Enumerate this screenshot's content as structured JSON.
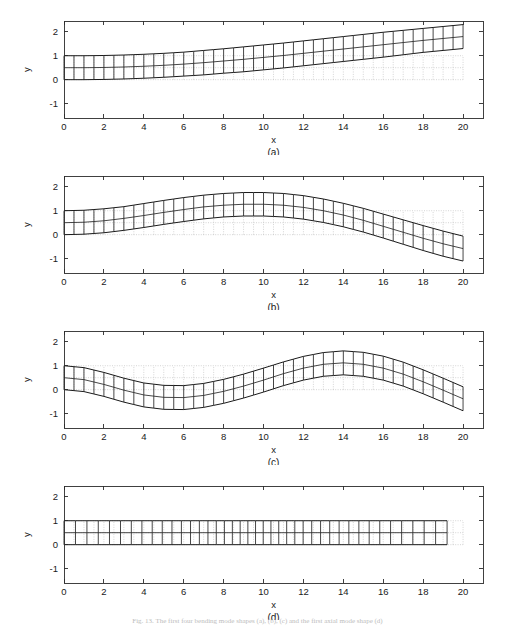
{
  "figure": {
    "width": 515,
    "height": 626,
    "background": "#ffffff",
    "caption": "Fig. 13. The first four bending mode shapes (a), (b), (c) and the first axial mode shape (d)"
  },
  "axes": {
    "xlabel": "x",
    "ylabel": "y",
    "xticks": [
      0,
      2,
      4,
      6,
      8,
      10,
      12,
      14,
      16,
      18,
      20
    ],
    "xtick_labels": [
      "0",
      "2",
      "4",
      "6",
      "8",
      "10",
      "12",
      "14",
      "16",
      "18",
      "20"
    ],
    "yticks": [
      -1,
      0,
      1,
      2
    ],
    "ytick_labels": [
      "-1",
      "0",
      "1",
      "2"
    ],
    "xlim": [
      0,
      21
    ],
    "ylim": [
      -1.6,
      2.45
    ],
    "grid": false,
    "line_color": "#2b2b2b",
    "ref_mesh_color": "#b9b9b9",
    "def_mesh_color": "#262626"
  },
  "chart_data": {
    "type": "line",
    "xlabel": "x",
    "ylabel": "y",
    "xlim": [
      0,
      21
    ],
    "ylim": [
      -1.6,
      2.45
    ],
    "grid": false,
    "legend": "none",
    "beam": {
      "length": 20,
      "height": 1.0,
      "n_elements_x": 40,
      "n_elements_y": 2,
      "reference_shape": "undeformed rectangular strip from x=0..20, y=0..1, drawn as light dotted mesh"
    },
    "panels": [
      {
        "label": "(a)",
        "mode": "first bending mode",
        "description": "Cantilever clamped at x=0, tip deflection upward, monotonically increasing slope",
        "x": [
          0,
          1,
          2,
          3,
          4,
          5,
          6,
          7,
          8,
          9,
          10,
          11,
          12,
          13,
          14,
          15,
          16,
          17,
          18,
          19,
          20
        ],
        "centerline_y": [
          0.5,
          0.5,
          0.51,
          0.53,
          0.56,
          0.6,
          0.65,
          0.71,
          0.78,
          0.85,
          0.93,
          1.01,
          1.1,
          1.19,
          1.28,
          1.37,
          1.46,
          1.55,
          1.64,
          1.72,
          1.8
        ],
        "top_y": [
          1.0,
          1.0,
          1.01,
          1.03,
          1.06,
          1.1,
          1.15,
          1.22,
          1.29,
          1.37,
          1.45,
          1.53,
          1.62,
          1.71,
          1.8,
          1.89,
          1.98,
          2.06,
          2.14,
          2.22,
          2.3
        ],
        "bottom_y": [
          0.0,
          0.0,
          0.01,
          0.03,
          0.06,
          0.1,
          0.15,
          0.2,
          0.27,
          0.33,
          0.41,
          0.49,
          0.58,
          0.67,
          0.76,
          0.85,
          0.94,
          1.04,
          1.14,
          1.22,
          1.3
        ]
      },
      {
        "label": "(b)",
        "mode": "second bending mode",
        "description": "One interior node; hump peaking near x=9.5 then descending below zero at the tip",
        "x": [
          0,
          1,
          2,
          3,
          4,
          5,
          6,
          7,
          8,
          9,
          10,
          11,
          12,
          13,
          14,
          15,
          16,
          17,
          18,
          19,
          20
        ],
        "centerline_y": [
          0.5,
          0.52,
          0.58,
          0.68,
          0.8,
          0.93,
          1.05,
          1.16,
          1.23,
          1.27,
          1.27,
          1.23,
          1.14,
          1.0,
          0.82,
          0.6,
          0.35,
          0.1,
          -0.15,
          -0.38,
          -0.58
        ],
        "top_y": [
          1.0,
          1.02,
          1.08,
          1.17,
          1.3,
          1.43,
          1.55,
          1.65,
          1.72,
          1.76,
          1.76,
          1.72,
          1.63,
          1.49,
          1.31,
          1.1,
          0.86,
          0.62,
          0.38,
          0.15,
          -0.06
        ],
        "bottom_y": [
          0.0,
          0.02,
          0.08,
          0.18,
          0.3,
          0.43,
          0.55,
          0.66,
          0.74,
          0.78,
          0.78,
          0.74,
          0.65,
          0.51,
          0.33,
          0.11,
          -0.14,
          -0.4,
          -0.66,
          -0.9,
          -1.1
        ]
      },
      {
        "label": "(c)",
        "mode": "third bending mode",
        "description": "Two interior nodes; trough near x=5.8 and crest near x=14, tip descending",
        "x": [
          0,
          1,
          2,
          3,
          4,
          5,
          6,
          7,
          8,
          9,
          10,
          11,
          12,
          13,
          14,
          15,
          16,
          17,
          18,
          19,
          20
        ],
        "centerline_y": [
          0.5,
          0.42,
          0.22,
          -0.02,
          -0.22,
          -0.32,
          -0.33,
          -0.24,
          -0.07,
          0.15,
          0.4,
          0.67,
          0.9,
          1.06,
          1.12,
          1.06,
          0.9,
          0.65,
          0.33,
          -0.02,
          -0.38
        ],
        "top_y": [
          1.0,
          0.92,
          0.72,
          0.48,
          0.28,
          0.18,
          0.17,
          0.26,
          0.43,
          0.65,
          0.9,
          1.16,
          1.39,
          1.55,
          1.62,
          1.56,
          1.4,
          1.15,
          0.83,
          0.48,
          0.12
        ],
        "bottom_y": [
          0.0,
          -0.08,
          -0.28,
          -0.52,
          -0.72,
          -0.82,
          -0.83,
          -0.74,
          -0.57,
          -0.35,
          -0.1,
          0.17,
          0.4,
          0.56,
          0.62,
          0.56,
          0.4,
          0.15,
          -0.17,
          -0.52,
          -0.88
        ]
      },
      {
        "label": "(d)",
        "mode": "first axial mode",
        "description": "Pure longitudinal stretching/compression; beam stays flat between y=0 and y=1, element widths vary sinusoidally, tip shortened to about x=19.2",
        "x": [
          0,
          1,
          2,
          3,
          4,
          5,
          6,
          7,
          8,
          9,
          10,
          11,
          12,
          13,
          14,
          15,
          16,
          17,
          18,
          19,
          20
        ],
        "centerline_y": [
          0.5,
          0.5,
          0.5,
          0.5,
          0.5,
          0.5,
          0.5,
          0.5,
          0.5,
          0.5,
          0.5,
          0.5,
          0.5,
          0.5,
          0.5,
          0.5,
          0.5,
          0.5,
          0.5,
          0.5,
          0.5
        ],
        "top_y": [
          1.0,
          1.0,
          1.0,
          1.0,
          1.0,
          1.0,
          1.0,
          1.0,
          1.0,
          1.0,
          1.0,
          1.0,
          1.0,
          1.0,
          1.0,
          1.0,
          1.0,
          1.0,
          1.0,
          1.0,
          1.0
        ],
        "bottom_y": [
          0.0,
          0.0,
          0.0,
          0.0,
          0.0,
          0.0,
          0.0,
          0.0,
          0.0,
          0.0,
          0.0,
          0.0,
          0.0,
          0.0,
          0.0,
          0.0,
          0.0,
          0.0,
          0.0,
          0.0,
          0.0
        ],
        "axial_tip_x": 19.2,
        "axial_amplitude": 0.22
      }
    ]
  }
}
